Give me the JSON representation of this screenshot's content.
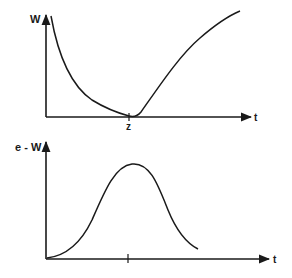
{
  "colors": {
    "ink": "#1a1a1a",
    "background": "#ffffff"
  },
  "top_plot": {
    "y_label": "W",
    "x_label": "t",
    "tick_label": "z",
    "description": "W(t) decreasing from high at t=0 to a minimum at t=z, then increasing"
  },
  "bottom_plot": {
    "y_label": "e - W",
    "x_label": "t",
    "description": "e^-W(t): bell-shaped curve, zero near t=0, peak at t=z, decaying afterwards"
  }
}
